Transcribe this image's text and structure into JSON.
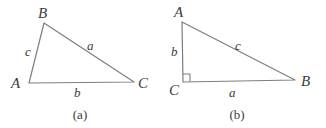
{
  "figure": {
    "background_color": "#ffffff",
    "stroke_color": "#7d7d7d",
    "text_color": "#3b3b3b",
    "panels": [
      {
        "id": "a",
        "caption": "(a)",
        "type": "oblique-triangle",
        "vertices": [
          {
            "name": "B",
            "label": "B",
            "x": 44,
            "y": 23,
            "label_x": 38,
            "label_y": 6
          },
          {
            "name": "A",
            "label": "A",
            "x": 29,
            "y": 83,
            "label_x": 11,
            "label_y": 76
          },
          {
            "name": "C",
            "label": "C",
            "x": 134,
            "y": 82,
            "label_x": 138,
            "label_y": 76
          }
        ],
        "sides": [
          {
            "name": "c",
            "label": "c",
            "from": "A",
            "to": "B",
            "label_x": 25,
            "label_y": 45
          },
          {
            "name": "a",
            "label": "a",
            "from": "B",
            "to": "C",
            "label_x": 87,
            "label_y": 39
          },
          {
            "name": "b",
            "label": "b",
            "from": "A",
            "to": "C",
            "label_x": 74,
            "label_y": 86
          }
        ],
        "right_angle": null,
        "caption_x": 80,
        "caption_y": 108
      },
      {
        "id": "b",
        "caption": "(b)",
        "type": "right-triangle",
        "vertices": [
          {
            "name": "A",
            "label": "A",
            "x": 19,
            "y": 22,
            "label_x": 11,
            "label_y": 5
          },
          {
            "name": "C",
            "label": "C",
            "x": 20,
            "y": 82,
            "label_x": 6,
            "label_y": 83
          },
          {
            "name": "B",
            "label": "B",
            "x": 132,
            "y": 80,
            "label_x": 138,
            "label_y": 74
          }
        ],
        "sides": [
          {
            "name": "b",
            "label": "b",
            "from": "A",
            "to": "C",
            "label_x": 8,
            "label_y": 45
          },
          {
            "name": "c",
            "label": "c",
            "from": "A",
            "to": "B",
            "label_x": 72,
            "label_y": 39
          },
          {
            "name": "a",
            "label": "a",
            "from": "C",
            "to": "B",
            "label_x": 66,
            "label_y": 86
          }
        ],
        "right_angle": {
          "at": "C",
          "size": 7
        },
        "caption_x": 237,
        "caption_y": 108
      }
    ]
  }
}
